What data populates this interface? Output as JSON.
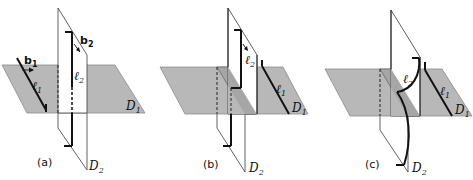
{
  "figure": {
    "panels": [
      {
        "id": "a",
        "caption": "(a)",
        "labels": {
          "b1": "b",
          "b1_sub": "1",
          "b2": "b",
          "b2_sub": "2",
          "l1": "ℓ",
          "l1_sub": "1",
          "l2": "ℓ",
          "l2_sub": "2",
          "D1": "D",
          "D1_sub": "1",
          "D2": "D",
          "D2_sub": "2"
        }
      },
      {
        "id": "b",
        "caption": "(b)",
        "labels": {
          "l1": "ℓ",
          "l1_sub": "1",
          "l2": "ℓ",
          "l2_sub": "2",
          "D1": "D",
          "D1_sub": "1",
          "D2": "D",
          "D2_sub": "2"
        }
      },
      {
        "id": "c",
        "caption": "(c)",
        "labels": {
          "l1": "ℓ",
          "l1_sub": "1",
          "l2": "ℓ",
          "l2_sub": "2",
          "D1": "D",
          "D1_sub": "1",
          "D2": "D",
          "D2_sub": "2"
        }
      }
    ],
    "colors": {
      "horizontal_plane": "#b8b8b8",
      "strip": "#a6a6a6",
      "vertical_plane": "#ffffff",
      "line": "#111111"
    }
  }
}
